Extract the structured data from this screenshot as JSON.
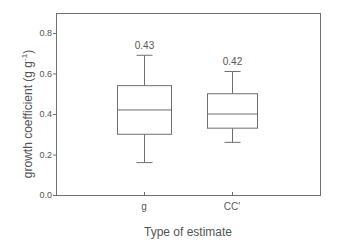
{
  "chart_data": {
    "type": "box",
    "title": "",
    "xlabel": "Type of estimate",
    "ylabel": "growth coefficient (g g",
    "ylabel_sup": "-1",
    "ylabel_close": ")",
    "ylim": [
      0.0,
      0.9
    ],
    "yticks": [
      0.0,
      0.2,
      0.4,
      0.6,
      0.8
    ],
    "ytick_labels": [
      "0.0",
      "0.2",
      "0.4",
      "0.6",
      "0.8"
    ],
    "grid": false,
    "legend": null,
    "categories": [
      "g",
      "CC'"
    ],
    "series": [
      {
        "name": "g",
        "whisker_low": 0.16,
        "q1": 0.3,
        "median": 0.42,
        "q3": 0.54,
        "whisker_high": 0.69,
        "annotation": "0.43"
      },
      {
        "name": "CC'",
        "whisker_low": 0.26,
        "q1": 0.33,
        "median": 0.4,
        "q3": 0.5,
        "whisker_high": 0.61,
        "annotation": "0.42"
      }
    ]
  }
}
